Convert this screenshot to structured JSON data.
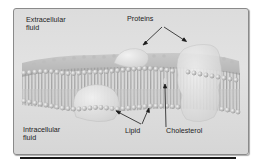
{
  "diagram": {
    "type": "cell-membrane-illustration",
    "labels": {
      "extracellular": "Extracellular\nfluid",
      "intracellular": "Intracellular\nfluid",
      "proteins": "Proteins",
      "lipid": "Lipid",
      "cholesterol": "Cholesterol"
    },
    "colors": {
      "frame_background": "#dcdcdc",
      "frame_border": "#8a8a8a",
      "lipid_head": "#c8c8c8",
      "lipid_tail": "#8c8c8c",
      "protein": "#e4e4e4",
      "arrow": "#1a1a1a",
      "rule": "#1a1a1a"
    },
    "components": [
      {
        "name": "phospholipid-bilayer",
        "label": "Lipid"
      },
      {
        "name": "membrane-protein-small-top",
        "label": "Proteins"
      },
      {
        "name": "membrane-protein-large-right",
        "label": "Proteins"
      },
      {
        "name": "membrane-protein-bottom-left"
      },
      {
        "name": "cholesterol-molecule",
        "label": "Cholesterol"
      }
    ]
  }
}
